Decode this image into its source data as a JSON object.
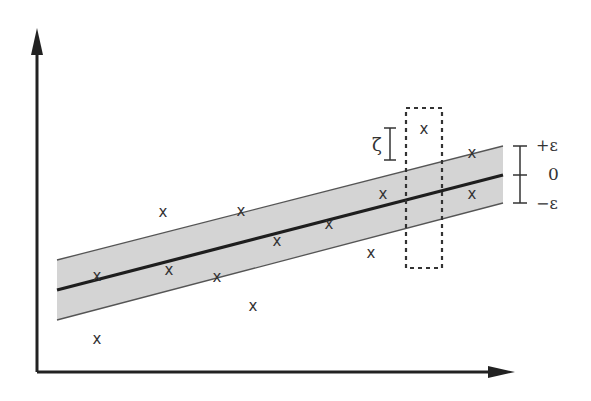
{
  "diagram": {
    "title": "",
    "type": "epsilon-insensitive regression band (SVR illustration)",
    "colors": {
      "axis": "#222222",
      "regression_line": "#1e1e1e",
      "band_fill": "#d4d4d4",
      "band_edge": "#555555",
      "points": "#333333",
      "dashed_box": "#333333"
    },
    "axes": {
      "x_axis": {
        "from": [
          37,
          372
        ],
        "to": [
          515,
          372
        ]
      },
      "y_axis": {
        "from": [
          37,
          372
        ],
        "to": [
          37,
          28
        ]
      }
    },
    "regression_line": {
      "from": [
        57,
        290
      ],
      "to": [
        503,
        175
      ]
    },
    "band": {
      "upper": {
        "from": [
          57,
          260
        ],
        "to": [
          503,
          146
        ]
      },
      "lower": {
        "from": [
          57,
          320
        ],
        "to": [
          503,
          203
        ]
      }
    },
    "points_marker": "x",
    "points": [
      {
        "x": 97,
        "y": 276
      },
      {
        "x": 97,
        "y": 339
      },
      {
        "x": 163,
        "y": 212
      },
      {
        "x": 169,
        "y": 270
      },
      {
        "x": 217,
        "y": 277
      },
      {
        "x": 241,
        "y": 211
      },
      {
        "x": 253,
        "y": 306
      },
      {
        "x": 277,
        "y": 241
      },
      {
        "x": 329,
        "y": 224
      },
      {
        "x": 371,
        "y": 253
      },
      {
        "x": 383,
        "y": 194
      },
      {
        "x": 424,
        "y": 129
      },
      {
        "x": 472,
        "y": 153
      },
      {
        "x": 472,
        "y": 194
      }
    ],
    "dashed_box": {
      "x": 406,
      "y": 108,
      "width": 36,
      "height": 160
    },
    "zeta_bracket": {
      "x": 390,
      "y_top": 128,
      "y_bottom": 160,
      "label": "ζ"
    },
    "epsilon_bracket": {
      "x": 520,
      "y_top": 146,
      "y_mid": 175,
      "y_bottom": 203,
      "labels": {
        "top": "+ε",
        "mid": "0",
        "bottom": "−ε"
      }
    }
  }
}
